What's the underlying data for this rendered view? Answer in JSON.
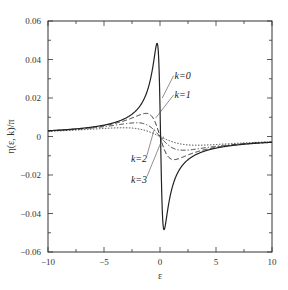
{
  "chart_data": {
    "type": "line",
    "title": "",
    "xlabel": "ε",
    "ylabel": "η(ε, k)/π",
    "xlim": [
      -10,
      10
    ],
    "ylim": [
      -0.06,
      0.06
    ],
    "grid": false,
    "legend_position": "inline labels with leader lines",
    "x_ticks": [
      -10,
      -5,
      0,
      5,
      10
    ],
    "x_tick_labels": [
      "−10",
      "−5",
      "0",
      "5",
      "10"
    ],
    "y_ticks": [
      -0.06,
      -0.04,
      -0.02,
      0,
      0.02,
      0.04,
      0.06
    ],
    "y_tick_labels": [
      "−0.06",
      "−0.04",
      "−0.02",
      "0",
      "0.02",
      "0.04",
      "0.06"
    ],
    "x": [
      -10,
      -8,
      -6,
      -4,
      -3,
      -2,
      -1.5,
      -1,
      -0.75,
      -0.5,
      -0.3,
      -0.15,
      0,
      0.15,
      0.3,
      0.5,
      0.75,
      1,
      1.5,
      2,
      3,
      4,
      6,
      8,
      10
    ],
    "series": [
      {
        "name": "k=0",
        "style": "solid",
        "peak": {
          "x": -0.27,
          "y": 0.048
        },
        "trough": {
          "x": 0.36,
          "y": -0.0475
        },
        "values": [
          0.003,
          0.0037,
          0.0049,
          0.0073,
          0.0096,
          0.0141,
          0.0183,
          0.0255,
          0.0307,
          0.037,
          0.0447,
          0.0451,
          0.0,
          -0.0451,
          -0.0447,
          -0.037,
          -0.0307,
          -0.0255,
          -0.0183,
          -0.0141,
          -0.0096,
          -0.0073,
          -0.0049,
          -0.0037,
          -0.003
        ]
      },
      {
        "name": "k=1",
        "style": "dashed",
        "peak": {
          "x": -1.25,
          "y": 0.012
        },
        "trough": {
          "x": 1.25,
          "y": -0.012
        },
        "values": [
          0.003,
          0.0036,
          0.0047,
          0.0068,
          0.0085,
          0.0108,
          0.0117,
          0.0117,
          0.0105,
          0.0086,
          0.0057,
          0.0029,
          0.0,
          -0.0029,
          -0.0057,
          -0.0086,
          -0.0105,
          -0.0117,
          -0.0117,
          -0.0108,
          -0.0085,
          -0.0068,
          -0.0047,
          -0.0036,
          -0.003
        ]
      },
      {
        "name": "k=2",
        "style": "dash-dot",
        "peak": {
          "x": -2.1,
          "y": 0.007
        },
        "trough": {
          "x": 2.1,
          "y": -0.007
        },
        "values": [
          0.0029,
          0.0034,
          0.0044,
          0.0059,
          0.0068,
          0.0071,
          0.0066,
          0.0056,
          0.0045,
          0.0032,
          0.002,
          0.001,
          0.0,
          -0.001,
          -0.002,
          -0.0032,
          -0.0045,
          -0.0056,
          -0.0066,
          -0.0071,
          -0.0068,
          -0.0059,
          -0.0044,
          -0.0034,
          -0.0029
        ]
      },
      {
        "name": "k=3",
        "style": "dotted",
        "peak": {
          "x": -3.3,
          "y": 0.0045
        },
        "trough": {
          "x": 3.3,
          "y": -0.0045
        },
        "values": [
          0.0027,
          0.0032,
          0.0039,
          0.0044,
          0.0045,
          0.0039,
          0.0033,
          0.0025,
          0.0019,
          0.0013,
          0.0008,
          0.0004,
          0.0,
          -0.0004,
          -0.0008,
          -0.0013,
          -0.0019,
          -0.0025,
          -0.0033,
          -0.0039,
          -0.0045,
          -0.0044,
          -0.0039,
          -0.0032,
          -0.0027
        ]
      }
    ],
    "model": {
      "form": "f(ε) = -a·ε / (ε² + γ²)",
      "a": 0.03,
      "gamma": {
        "k=0": 0.31,
        "k=1": 1.25,
        "k=2": 2.1,
        "k=3": 3.3
      }
    },
    "annotations": [
      {
        "text": "k=0",
        "label_at": [
          1.3,
          0.03
        ],
        "points_to": [
          0.2,
          0.02
        ]
      },
      {
        "text": "k=1",
        "label_at": [
          1.3,
          0.02
        ],
        "points_to": [
          -0.4,
          0.0095
        ]
      },
      {
        "text": "k=2",
        "label_at": [
          -2.6,
          -0.013
        ],
        "points_to": [
          -0.5,
          0.004
        ]
      },
      {
        "text": "k=3",
        "label_at": [
          -2.6,
          -0.024
        ],
        "points_to": [
          0.3,
          0.0
        ]
      }
    ]
  }
}
